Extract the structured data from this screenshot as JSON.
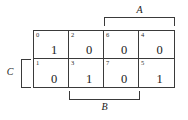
{
  "diagram": {
    "type": "karnaugh-map",
    "variables": [
      "A",
      "B",
      "C"
    ],
    "rows": 2,
    "columns": 4,
    "cells": [
      {
        "index": "0",
        "value": "1",
        "row": 0,
        "col": 0
      },
      {
        "index": "2",
        "value": "0",
        "row": 0,
        "col": 1
      },
      {
        "index": "6",
        "value": "0",
        "row": 0,
        "col": 2
      },
      {
        "index": "4",
        "value": "0",
        "row": 0,
        "col": 3
      },
      {
        "index": "1",
        "value": "0",
        "row": 1,
        "col": 0
      },
      {
        "index": "3",
        "value": "1",
        "row": 1,
        "col": 1
      },
      {
        "index": "7",
        "value": "0",
        "row": 1,
        "col": 2
      },
      {
        "index": "5",
        "value": "1",
        "row": 1,
        "col": 3
      }
    ],
    "brackets": [
      {
        "label": "A",
        "position": "top",
        "spans_columns": [
          2,
          3
        ]
      },
      {
        "label": "B",
        "position": "bottom",
        "spans_columns": [
          1,
          2
        ]
      },
      {
        "label": "C",
        "position": "left",
        "spans_rows": [
          1
        ]
      }
    ],
    "colors": {
      "line": "#3a3a3a",
      "text": "#1a1a1a",
      "background": "#ffffff"
    }
  }
}
